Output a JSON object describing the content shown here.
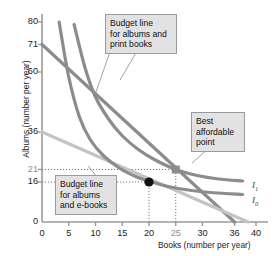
{
  "chart_data": {
    "type": "line",
    "title": "",
    "xlabel": "Books (number per year)",
    "ylabel": "Albums (number per year)",
    "xlim": [
      0,
      42
    ],
    "ylim": [
      0,
      84
    ],
    "grid": false,
    "legend": "inline-labels",
    "xticks": [
      {
        "value": 0,
        "label": "0"
      },
      {
        "value": 5,
        "label": "5"
      },
      {
        "value": 10,
        "label": "10"
      },
      {
        "value": 15,
        "label": "15"
      },
      {
        "value": 20,
        "label": "20"
      },
      {
        "value": 25,
        "label": "25",
        "dim": true
      },
      {
        "value": 30,
        "label": "30"
      },
      {
        "value": 36,
        "label": "36"
      },
      {
        "value": 40,
        "label": "40"
      }
    ],
    "yticks": [
      {
        "value": 80,
        "label": "80"
      },
      {
        "value": 71,
        "label": "71"
      },
      {
        "value": 60,
        "label": "60"
      },
      {
        "value": 36,
        "label": "36"
      },
      {
        "value": 21,
        "label": "21",
        "dim": true
      },
      {
        "value": 16,
        "label": "16"
      },
      {
        "value": 0,
        "label": "0"
      }
    ],
    "series": [
      {
        "name": "Budget line for albums and print books",
        "kind": "budget",
        "color": "#8c8c8c",
        "points": [
          [
            0,
            71
          ],
          [
            36,
            0
          ]
        ]
      },
      {
        "name": "Budget line for albums and e-books",
        "kind": "budget",
        "color": "#c4c4c4",
        "points": [
          [
            0,
            36
          ],
          [
            38.5,
            0
          ]
        ]
      },
      {
        "name": "I1",
        "kind": "indifference",
        "color": "#8c8c8c",
        "points": [
          [
            6,
            79
          ],
          [
            8,
            62
          ],
          [
            10,
            50
          ],
          [
            12.5,
            41
          ],
          [
            15,
            34.5
          ],
          [
            18,
            29
          ],
          [
            21,
            25
          ],
          [
            25,
            21
          ],
          [
            29,
            18.6
          ],
          [
            33,
            17.2
          ],
          [
            37.5,
            16.4
          ]
        ]
      },
      {
        "name": "I0",
        "kind": "indifference",
        "color": "#8c8c8c",
        "points": [
          [
            3.2,
            80
          ],
          [
            5,
            58
          ],
          [
            7,
            42
          ],
          [
            9,
            33
          ],
          [
            11.5,
            26.5
          ],
          [
            14.5,
            21.5
          ],
          [
            17.5,
            18.2
          ],
          [
            20,
            16.3
          ],
          [
            24,
            14.0
          ],
          [
            28,
            12.6
          ],
          [
            32,
            11.7
          ],
          [
            37.5,
            11.0
          ]
        ]
      }
    ],
    "markers": [
      {
        "name": "best-affordable-point-ebooks",
        "x": 20,
        "y": 16,
        "shape": "circle",
        "color": "#111111"
      },
      {
        "name": "best-affordable-point-print",
        "x": 25,
        "y": 21,
        "shape": "square",
        "color": "#8c8c8c"
      }
    ],
    "guides": [
      {
        "from": [
          0,
          21
        ],
        "to": [
          25,
          21
        ]
      },
      {
        "from": [
          25,
          0
        ],
        "to": [
          25,
          21
        ]
      },
      {
        "from": [
          0,
          16
        ],
        "to": [
          20,
          16
        ]
      },
      {
        "from": [
          20,
          0
        ],
        "to": [
          20,
          16
        ]
      }
    ],
    "annotations": [
      {
        "name": "callout-print-budget",
        "text": "Budget line for albums and print books",
        "lines": [
          "Budget line",
          "for albums and",
          "print books"
        ]
      },
      {
        "name": "callout-ebook-budget",
        "text": "Budget line for albums and e-books",
        "lines": [
          "Budget line",
          "for albums",
          "and e-books"
        ]
      },
      {
        "name": "callout-best-point",
        "text": "Best affordable point",
        "lines": [
          "Best",
          "affordable",
          "point"
        ]
      }
    ],
    "curve_labels": [
      {
        "name": "curve-label-i1",
        "base": "I",
        "sub": "1"
      },
      {
        "name": "curve-label-i0",
        "base": "I",
        "sub": "0"
      }
    ]
  }
}
